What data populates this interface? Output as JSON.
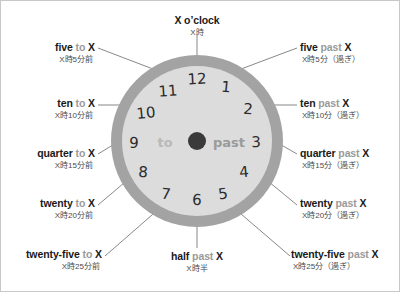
{
  "canvas": {
    "width": 400,
    "height": 292,
    "background": "#ffffff"
  },
  "clock": {
    "center_x": 196,
    "center_y": 140,
    "outer_radius": 86,
    "face_radius": 75,
    "ring_color": "#a3a3a3",
    "face_color": "#dcdcdc",
    "hub_color": "#3a3a3a",
    "hub_radius": 9,
    "numerals": [
      "1",
      "2",
      "3",
      "4",
      "5",
      "6",
      "7",
      "8",
      "9",
      "10",
      "11",
      "12"
    ],
    "center_left_word": "to",
    "center_right_word": "past"
  },
  "colors": {
    "text_dark": "#1a1a1a",
    "text_soft": "#9a9a9a",
    "text_jp": "#4a4a4a",
    "leader_line": "#555555",
    "border": "#c8c8c8"
  },
  "labels": [
    {
      "id": "o-clock",
      "en_a": "X o’clock",
      "en_soft": "",
      "en_b": "",
      "jp": "X時"
    },
    {
      "id": "five-past",
      "en_a": "five",
      "en_soft": "past",
      "en_b": "X",
      "jp": "X時10分（過ぎ）"
    },
    {
      "id": "ten-past",
      "en_a": "ten",
      "en_soft": "past",
      "en_b": "X",
      "jp": "X時10分（過ぎ）"
    },
    {
      "id": "quarter-past",
      "en_a": "quarter",
      "en_soft": "past",
      "en_b": "X",
      "jp": "X時15分（過ぎ）"
    },
    {
      "id": "twenty-past",
      "en_a": "twenty",
      "en_soft": "past",
      "en_b": "X",
      "jp": "X時20分（過ぎ）"
    },
    {
      "id": "twentyfive-past",
      "en_a": "twenty-five",
      "en_soft": "past",
      "en_b": "X",
      "jp": "X時25分（過ぎ）"
    },
    {
      "id": "half-past",
      "en_a": "half",
      "en_soft": "past",
      "en_b": "X",
      "jp": "X時半"
    },
    {
      "id": "twentyfive-to",
      "en_a": "twenty-five",
      "en_soft": "to",
      "en_b": "X",
      "jp": "X時25分前"
    },
    {
      "id": "twenty-to",
      "en_a": "twenty",
      "en_soft": "to",
      "en_b": "X",
      "jp": "X時20分前"
    },
    {
      "id": "quarter-to",
      "en_a": "quarter",
      "en_soft": "to",
      "en_b": "X",
      "jp": "X時15分前"
    },
    {
      "id": "ten-to",
      "en_a": "ten",
      "en_soft": "to",
      "en_b": "X",
      "jp": "X時10分前"
    },
    {
      "id": "five-to",
      "en_a": "five",
      "en_soft": "to",
      "en_b": "X",
      "jp": "X時5分前"
    }
  ],
  "labels_fixed": {
    "five_past_jp": "X時5分（過ぎ）"
  }
}
